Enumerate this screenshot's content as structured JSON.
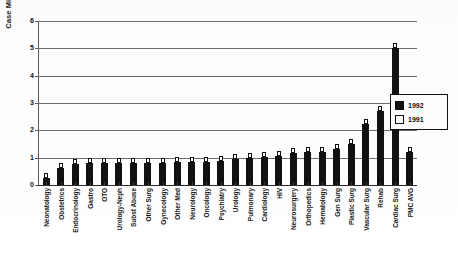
{
  "chart_data": {
    "type": "bar",
    "title": "",
    "xlabel": "",
    "ylabel": "Case Mix Index",
    "ylim": [
      0,
      6
    ],
    "yticks": [
      0,
      1,
      2,
      3,
      4,
      5,
      6
    ],
    "ytick_labels": [
      "0",
      "1",
      "2",
      "3",
      "4",
      "5",
      "6"
    ],
    "grid": true,
    "legend_position": "right",
    "categories": [
      "Neonatology",
      "Obstetrics",
      "Endocrinology",
      "Gastro",
      "OTO",
      "Urology-Neph",
      "Subst Abuse",
      "Other Surg",
      "Gynecology",
      "Other Med",
      "Neurology",
      "Oncology",
      "Psychiatry",
      "Urology",
      "Pulmonary",
      "Cardiology",
      "HIV",
      "Neurosurgery",
      "Orthopedics",
      "Hematology",
      "Gen Surg",
      "Plastic Surg",
      "Vascular Surg",
      "Rehab",
      "Cardiac Surg",
      "PMC AVG"
    ],
    "series": [
      {
        "name": "1992",
        "color": "#111111",
        "values": [
          0.25,
          0.62,
          0.78,
          0.79,
          0.8,
          0.8,
          0.8,
          0.8,
          0.82,
          0.83,
          0.84,
          0.86,
          0.88,
          0.95,
          1.0,
          1.02,
          1.05,
          1.18,
          1.2,
          1.22,
          1.3,
          1.5,
          2.22,
          2.7,
          5.0,
          1.2
        ]
      },
      {
        "name": "1991",
        "color": "#ffffff",
        "values": [
          0.28,
          0.66,
          0.82,
          0.83,
          0.84,
          0.84,
          0.84,
          0.84,
          0.86,
          0.87,
          0.88,
          0.9,
          0.92,
          0.99,
          1.04,
          1.06,
          1.1,
          1.23,
          1.25,
          1.27,
          1.35,
          1.56,
          2.28,
          2.76,
          5.06,
          1.25
        ]
      }
    ]
  },
  "legend": {
    "items": [
      {
        "label": "1992",
        "swatch": "black"
      },
      {
        "label": "1991",
        "swatch": "white"
      }
    ]
  },
  "colors": {
    "series_1992": "#111111",
    "series_1991": "#ffffff",
    "axis": "#2a2a2a",
    "gridline": "#6e6e6e",
    "background": "#ffffff"
  }
}
